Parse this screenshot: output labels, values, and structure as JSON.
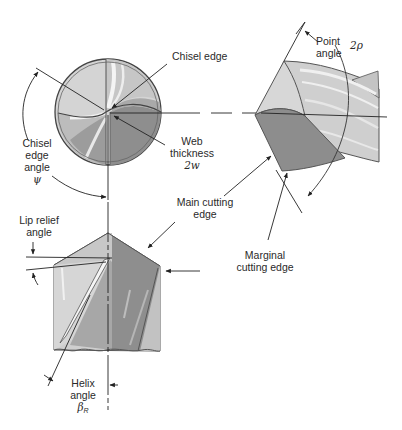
{
  "diagram": {
    "views": [
      "end-view",
      "side-view-point",
      "side-view-helix"
    ],
    "labels": {
      "chisel_edge": "Chisel edge",
      "point_angle_line1": "Point",
      "point_angle_line2": "angle",
      "point_angle_symbol": "2ρ",
      "chisel_edge_angle_line1": "Chisel",
      "chisel_edge_angle_line2": "edge",
      "chisel_edge_angle_line3": "angle",
      "chisel_edge_angle_symbol": "ψ",
      "web_thickness_line1": "Web",
      "web_thickness_line2": "thickness",
      "web_thickness_symbol": "2w",
      "main_cutting_edge_line1": "Main cutting",
      "main_cutting_edge_line2": "edge",
      "lip_relief_line1": "Lip relief",
      "lip_relief_line2": "angle",
      "marginal_line1": "Marginal",
      "marginal_line2": "cutting edge",
      "helix_line1": "Helix",
      "helix_line2": "angle",
      "helix_symbol": "β",
      "helix_subscript": "R"
    },
    "colors": {
      "light": "#d9d9d9",
      "mid": "#b4b4b4",
      "dark": "#8f8f8f",
      "line": "#3a3a3a",
      "highlight": "#f2f2f2"
    }
  }
}
